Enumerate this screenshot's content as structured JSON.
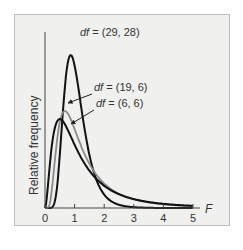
{
  "chart_data": {
    "type": "line",
    "title": "",
    "xlabel": "F",
    "ylabel": "Relative frequency",
    "xlim": [
      0,
      5
    ],
    "xticks": [
      "0",
      "1",
      "2",
      "3",
      "4",
      "5"
    ],
    "grid": false,
    "series": [
      {
        "name": "df = (29, 28)",
        "color": "#111111",
        "mode": 1.0,
        "peak_density": 1.28
      },
      {
        "name": "df = (19, 6)",
        "color": "#8a8a8a",
        "mode": 0.79,
        "peak_density": 0.72
      },
      {
        "name": "df = (6, 6)",
        "color": "#111111",
        "mode": 0.5,
        "peak_density": 0.64
      }
    ],
    "annotations": [
      {
        "text": "df = (29, 28)",
        "target": "df = (29, 28)"
      },
      {
        "text": "df = (19, 6)",
        "target": "df = (19, 6)",
        "arrow": true
      },
      {
        "text": "df = (6, 6)",
        "target": "df = (6, 6)",
        "arrow": true
      }
    ]
  }
}
